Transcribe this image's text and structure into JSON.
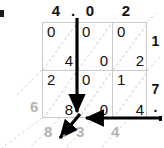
{
  "figure": {
    "kind": "lattice-multiplication",
    "top_labels": [
      "4",
      ".",
      "0",
      "2"
    ],
    "right_labels": [
      "1",
      "7",
      "."
    ],
    "grid": {
      "rows": 2,
      "cols": 3,
      "cells": [
        [
          {
            "upper": "0",
            "lower": "4"
          },
          {
            "upper": "0",
            "lower": "0"
          },
          {
            "upper": "0",
            "lower": "2"
          }
        ],
        [
          {
            "upper": "2",
            "lower": "8"
          },
          {
            "upper": "0",
            "lower": "0"
          },
          {
            "upper": "1",
            "lower": "4"
          }
        ]
      ]
    },
    "result_digits": [
      "6",
      "8",
      ".",
      "3",
      "4"
    ],
    "colors": {
      "grid_line": "#c9c9c9",
      "diagonal": "#d8d8d8",
      "digit": "#111111",
      "result_digit": "#b4b4b4",
      "arrow": "#000000",
      "background": "#ffffff"
    }
  }
}
